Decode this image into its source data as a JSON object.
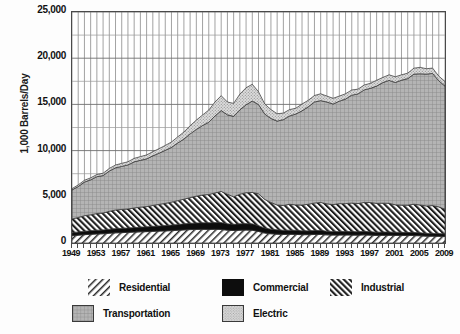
{
  "chart_data": {
    "type": "area",
    "stacked": true,
    "title": "",
    "xlabel": "",
    "ylabel": "1,000 Barrels/Day",
    "ylim": [
      0,
      25000
    ],
    "ytick_labels": [
      "0",
      "5,000",
      "10,000",
      "15,000",
      "20,000",
      "25,000"
    ],
    "ytick_values": [
      0,
      5000,
      10000,
      15000,
      20000,
      25000
    ],
    "grid": true,
    "legend_position": "bottom",
    "xlim": [
      1949,
      2010
    ],
    "xtick_labels": [
      "1949",
      "1953",
      "1957",
      "1961",
      "1965",
      "1969",
      "1973",
      "1977",
      "1981",
      "1985",
      "1989",
      "1993",
      "1997",
      "2001",
      "2005",
      "2009"
    ],
    "xtick_values": [
      1949,
      1953,
      1957,
      1961,
      1965,
      1969,
      1973,
      1977,
      1981,
      1985,
      1989,
      1993,
      1997,
      2001,
      2005,
      2009
    ],
    "x": [
      1949,
      1950,
      1951,
      1952,
      1953,
      1954,
      1955,
      1956,
      1957,
      1958,
      1959,
      1960,
      1961,
      1962,
      1963,
      1964,
      1965,
      1966,
      1967,
      1968,
      1969,
      1970,
      1971,
      1972,
      1973,
      1974,
      1975,
      1976,
      1977,
      1978,
      1979,
      1980,
      1981,
      1982,
      1983,
      1984,
      1985,
      1986,
      1987,
      1988,
      1989,
      1990,
      1991,
      1992,
      1993,
      1994,
      1995,
      1996,
      1997,
      1998,
      1999,
      2000,
      2001,
      2002,
      2003,
      2004,
      2005,
      2006,
      2007,
      2008,
      2009
    ],
    "series": [
      {
        "name": "Residential",
        "pattern": "diagonal-hatch-light",
        "values": [
          790,
          850,
          900,
          940,
          980,
          1000,
          1060,
          1100,
          1120,
          1150,
          1180,
          1210,
          1230,
          1260,
          1290,
          1310,
          1340,
          1380,
          1420,
          1450,
          1470,
          1480,
          1470,
          1480,
          1470,
          1390,
          1350,
          1390,
          1400,
          1380,
          1250,
          1080,
          1000,
          960,
          930,
          940,
          930,
          900,
          900,
          920,
          930,
          880,
          860,
          860,
          870,
          860,
          850,
          880,
          850,
          820,
          830,
          830,
          820,
          810,
          810,
          810,
          780,
          740,
          740,
          720,
          700
        ]
      },
      {
        "name": "Commercial",
        "pattern": "solid-black",
        "values": [
          330,
          350,
          370,
          390,
          410,
          420,
          440,
          460,
          470,
          480,
          490,
          510,
          520,
          540,
          560,
          580,
          600,
          620,
          650,
          680,
          700,
          710,
          720,
          730,
          740,
          690,
          670,
          690,
          700,
          690,
          630,
          540,
          500,
          470,
          450,
          450,
          440,
          420,
          420,
          430,
          440,
          400,
          390,
          390,
          390,
          380,
          370,
          380,
          370,
          350,
          360,
          360,
          350,
          340,
          340,
          340,
          330,
          310,
          310,
          300,
          290
        ]
      },
      {
        "name": "Industrial",
        "pattern": "diagonal-hatch-dense",
        "values": [
          1480,
          1560,
          1680,
          1720,
          1800,
          1820,
          1930,
          2010,
          2040,
          2050,
          2120,
          2160,
          2190,
          2260,
          2330,
          2400,
          2480,
          2580,
          2670,
          2780,
          2900,
          3000,
          3060,
          3200,
          3370,
          3200,
          2980,
          3200,
          3340,
          3400,
          3440,
          3100,
          2890,
          2680,
          2670,
          2800,
          2750,
          2780,
          2870,
          2980,
          3020,
          2960,
          2910,
          3010,
          3000,
          3080,
          3050,
          3130,
          3160,
          3120,
          3120,
          3110,
          2960,
          2940,
          2940,
          3050,
          3000,
          2960,
          3000,
          2890,
          2660
        ]
      },
      {
        "name": "Transportation",
        "pattern": "crosshatch-grid",
        "values": [
          3140,
          3350,
          3640,
          3790,
          3990,
          4060,
          4360,
          4570,
          4660,
          4770,
          4990,
          5070,
          5160,
          5370,
          5540,
          5740,
          5930,
          6240,
          6510,
          6900,
          7220,
          7530,
          7820,
          8330,
          8760,
          8590,
          8710,
          9130,
          9520,
          9890,
          9670,
          9240,
          9090,
          9080,
          9300,
          9560,
          9840,
          10200,
          10550,
          10930,
          11020,
          11020,
          10880,
          11090,
          11320,
          11680,
          11860,
          12180,
          12360,
          12690,
          13050,
          13300,
          13240,
          13530,
          13700,
          14080,
          14200,
          14270,
          14300,
          13650,
          13330
        ]
      },
      {
        "name": "Electric",
        "pattern": "stipple-dots",
        "values": [
          140,
          180,
          200,
          210,
          230,
          250,
          280,
          300,
          330,
          340,
          380,
          400,
          430,
          460,
          490,
          530,
          580,
          660,
          760,
          880,
          1010,
          1130,
          1320,
          1520,
          1600,
          1390,
          1400,
          1700,
          1840,
          1820,
          1380,
          1090,
          960,
          800,
          710,
          690,
          620,
          740,
          700,
          700,
          740,
          640,
          620,
          550,
          570,
          560,
          520,
          530,
          540,
          630,
          560,
          600,
          620,
          580,
          590,
          640,
          700,
          580,
          580,
          500,
          500
        ]
      }
    ],
    "totals": [
      5880,
      6290,
      6790,
      7050,
      7410,
      7550,
      8070,
      8440,
      8620,
      8790,
      9160,
      9350,
      9530,
      9890,
      10210,
      10560,
      10930,
      11480,
      12010,
      12690,
      13300,
      13850,
      14390,
      15260,
      15940,
      15260,
      15110,
      16110,
      16800,
      17180,
      16370,
      15050,
      14440,
      13990,
      14060,
      14440,
      14580,
      15040,
      15440,
      15960,
      16150,
      15900,
      15660,
      15900,
      16150,
      16560,
      16650,
      17100,
      17280,
      17610,
      17920,
      18200,
      17990,
      18200,
      18380,
      18920,
      19010,
      18860,
      18930,
      18060,
      17480
    ]
  },
  "legend": {
    "items": [
      {
        "label": "Residential",
        "pattern": "diagonal-hatch-light",
        "bordered": false
      },
      {
        "label": "Commercial",
        "pattern": "solid-black",
        "bordered": false
      },
      {
        "label": "Industrial",
        "pattern": "diagonal-hatch-dense",
        "bordered": false
      },
      {
        "label": "Transportation",
        "pattern": "crosshatch-grid",
        "bordered": true
      },
      {
        "label": "Electric",
        "pattern": "stipple-dots",
        "bordered": true
      }
    ]
  },
  "colors": {
    "axis": "#4a4a4a",
    "grid": "#7d7d7d",
    "text": "#111111",
    "commercial": "#0d0d0d",
    "transportation_fill": "#b4b4b4",
    "electric_fill": "#d2d2d2",
    "hatch": "#2b2b2b",
    "background": "#ffffff"
  }
}
